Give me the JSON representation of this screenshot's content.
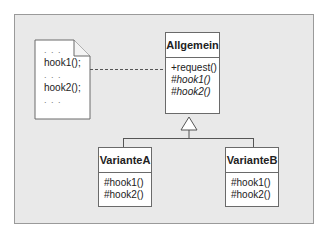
{
  "diagram": {
    "type": "uml-class-diagram",
    "note": {
      "lines": [
        ". . .",
        "hook1();",
        ". . .",
        "hook2();",
        ". . ."
      ]
    },
    "classes": [
      {
        "id": "allgemein",
        "name": "Allgemein",
        "operations": [
          {
            "label": "+request()",
            "italic": false
          },
          {
            "label": "#hook1()",
            "italic": true
          },
          {
            "label": "#hook2()",
            "italic": true
          }
        ]
      },
      {
        "id": "varianteA",
        "name": "VarianteA",
        "operations": [
          {
            "label": "#hook1()",
            "italic": false
          },
          {
            "label": "#hook2()",
            "italic": false
          }
        ]
      },
      {
        "id": "varianteB",
        "name": "VarianteB",
        "operations": [
          {
            "label": "#hook1()",
            "italic": false
          },
          {
            "label": "#hook2()",
            "italic": false
          }
        ]
      }
    ],
    "relations": [
      {
        "type": "note-link",
        "from": "note",
        "to": "allgemein.request",
        "style": "dashed"
      },
      {
        "type": "generalization",
        "from": "varianteA",
        "to": "allgemein"
      },
      {
        "type": "generalization",
        "from": "varianteB",
        "to": "allgemein"
      }
    ],
    "colors": {
      "background": "#e9e9e9",
      "frame_border": "#9a9a9a",
      "box_fill": "#ffffff",
      "box_border": "#6a6a6a"
    }
  }
}
